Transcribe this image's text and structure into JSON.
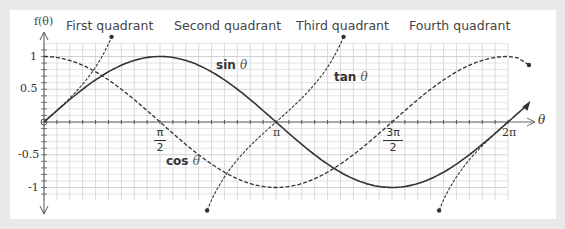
{
  "chart_data": {
    "type": "line",
    "title": "",
    "xlabel": "θ",
    "ylabel": "f(θ)",
    "xlim": [
      0,
      6.2832
    ],
    "ylim": [
      -1.2,
      1.2
    ],
    "grid": true,
    "x_ticks": [
      "π/2",
      "π",
      "3π/2",
      "2π"
    ],
    "y_ticks": [
      "1",
      "0.5",
      "-0.5",
      "-1"
    ],
    "regions": [
      "First quadrant",
      "Second quadrant",
      "Third quadrant",
      "Fourth quadrant"
    ],
    "series": [
      {
        "name": "sin θ",
        "style": "solid",
        "function": "sin",
        "x": [
          0,
          0.785,
          1.571,
          2.356,
          3.142,
          3.927,
          4.712,
          5.498,
          6.283
        ],
        "values": [
          0,
          0.707,
          1,
          0.707,
          0,
          -0.707,
          -1,
          -0.707,
          0
        ]
      },
      {
        "name": "cos θ",
        "style": "dashed",
        "function": "cos",
        "x": [
          0,
          0.785,
          1.571,
          2.356,
          3.142,
          3.927,
          4.712,
          5.498,
          6.283
        ],
        "values": [
          1,
          0.707,
          0,
          -0.707,
          -1,
          -0.707,
          0,
          0.707,
          1
        ]
      },
      {
        "name": "tan θ",
        "style": "dashed",
        "function": "tan",
        "x": [
          0,
          0.785,
          1.2,
          2.4,
          3.142,
          3.9,
          5.0,
          5.498,
          6.283
        ],
        "values": [
          0,
          1,
          2.57,
          -0.92,
          0,
          0.96,
          -3.38,
          -1,
          0
        ]
      }
    ]
  },
  "labels": {
    "y_axis": "f(θ)",
    "x_axis": "θ",
    "q1": "First quadrant",
    "q2": "Second quadrant",
    "q3": "Third quadrant",
    "q4": "Fourth quadrant",
    "sin_name": "sin",
    "cos_name": "cos",
    "tan_name": "tan",
    "theta": "θ",
    "y_1": "1",
    "y_05": "0.5",
    "y_m05": "-0.5",
    "y_m1": "-1",
    "x_pi": "π",
    "x_2pi": "2π",
    "x_pi2_num": "π",
    "x_pi2_den": "2",
    "x_3pi2_num": "3π",
    "x_3pi2_den": "2"
  },
  "colors": {
    "background": "#e9e9e9",
    "card": "#ffffff",
    "grid": "#d2d2d2",
    "curve": "#333333"
  }
}
